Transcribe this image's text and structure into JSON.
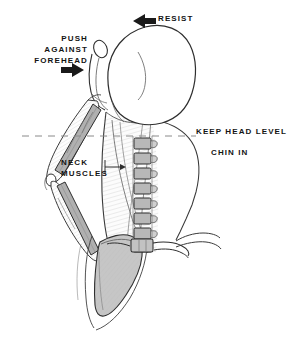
{
  "figure": {
    "background_color": "#ffffff",
    "ink_color": "#141414",
    "bone_fill_color": "#b8b8b8",
    "muscle_fill_color": "#e8e8e8",
    "width": 290,
    "height": 341
  },
  "annotations": {
    "resist": {
      "label": "RESIST",
      "arrow_direction": "left",
      "arrow_icon": "arrow-left-icon"
    },
    "push_against_forehead": {
      "line1": "PUSH",
      "line2": "AGAINST",
      "line3": "FOREHEAD",
      "label": "PUSH\nAGAINST\nFOREHEAD",
      "arrow_direction": "right",
      "arrow_icon": "arrow-right-icon"
    },
    "keep_head_level": {
      "label": "KEEP HEAD LEVEL"
    },
    "chin_in": {
      "label": "CHIN IN"
    },
    "neck_muscles": {
      "line1": "NECK",
      "line2": "MUSCLES",
      "label": "NECK\nMUSCLES",
      "leader_arrow_direction": "right",
      "leader_icon": "arrow-right-icon"
    }
  },
  "anatomy": {
    "head": "skull-posterior",
    "ear": "ear-outline",
    "cervical_spine": {
      "name": "cervical-vertebrae-column",
      "vertebra_count": 9,
      "fill": "#b8b8b8"
    },
    "scapula": "scapula-shape",
    "humerus": "humerus-bone",
    "forearm": "forearm-bone",
    "neck_muscle_shading": "neck-muscle-hatching",
    "reference_line": "dashed-horizontal-head-level-line"
  }
}
